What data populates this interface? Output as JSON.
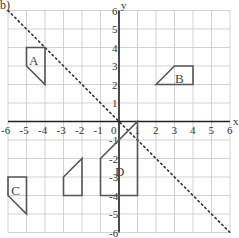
{
  "part_label": "b)",
  "axes": {
    "x_label": "x",
    "y_label": "y",
    "origin_label": "0",
    "x_ticks": [
      "-6",
      "-5",
      "-4",
      "-3",
      "-2",
      "-1",
      "1",
      "2",
      "3",
      "4",
      "5",
      "6"
    ],
    "y_ticks": [
      "6",
      "5",
      "4",
      "3",
      "2",
      "1",
      "-1",
      "-2",
      "-3",
      "-4",
      "-5",
      "-6"
    ],
    "range": [
      -6,
      6
    ]
  },
  "mirror_line": {
    "equation": "y = -x",
    "style": "dotted",
    "from": [
      -6,
      6
    ],
    "to": [
      6,
      -6
    ]
  },
  "shapes": [
    {
      "label": "A",
      "points": [
        [
          -5,
          4
        ],
        [
          -4,
          4
        ],
        [
          -4,
          2
        ],
        [
          -5,
          3
        ]
      ],
      "label_pos": [
        -4.6,
        3.3
      ]
    },
    {
      "label": "B",
      "points": [
        [
          2,
          2
        ],
        [
          3,
          3
        ],
        [
          4,
          3
        ],
        [
          4,
          2
        ]
      ],
      "label_pos": [
        3.3,
        2.35
      ]
    },
    {
      "label": "C",
      "points": [
        [
          -6,
          -3
        ],
        [
          -5,
          -3
        ],
        [
          -5,
          -5
        ],
        [
          -6,
          -4
        ]
      ],
      "label_pos": [
        -5.55,
        -3.7
      ]
    },
    {
      "label": "",
      "points": [
        [
          -3,
          -3
        ],
        [
          -2,
          -2
        ],
        [
          -2,
          -4
        ],
        [
          -3,
          -4
        ]
      ],
      "label_pos": null
    },
    {
      "label": "D",
      "points": [
        [
          -1,
          -4
        ],
        [
          1,
          -4
        ],
        [
          1,
          0
        ],
        [
          -1,
          -2
        ]
      ],
      "label_pos": [
        0.05,
        -2.7
      ]
    }
  ],
  "colors": {
    "grid": "#c8c8c8",
    "axis": "#222222",
    "shape": "#555555"
  }
}
